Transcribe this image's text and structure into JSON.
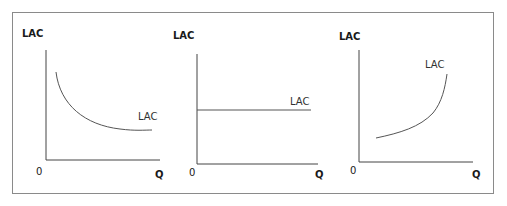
{
  "figure": {
    "panels": [
      {
        "id": "decreasing",
        "y_axis_label": "LAC",
        "x_axis_label": "Q",
        "origin_label": "0",
        "curve_label": "LAC",
        "shape": "decreasing"
      },
      {
        "id": "constant",
        "y_axis_label": "LAC",
        "x_axis_label": "Q",
        "origin_label": "0",
        "curve_label": "LAC",
        "shape": "constant"
      },
      {
        "id": "increasing",
        "y_axis_label": "LAC",
        "x_axis_label": "Q",
        "origin_label": "0",
        "curve_label": "LAC",
        "shape": "increasing"
      }
    ],
    "colors": {
      "axis": "#444444",
      "curve": "#555555",
      "border": "#8a8a8a"
    }
  }
}
